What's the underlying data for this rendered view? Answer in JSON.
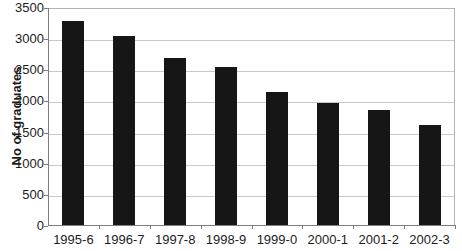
{
  "chart_data": {
    "type": "bar",
    "title": "",
    "xlabel": "",
    "ylabel": "No of graduates",
    "categories": [
      "1995-6",
      "1996-7",
      "1997-8",
      "1998-9",
      "1999-0",
      "2000-1",
      "2001-2",
      "2002-3"
    ],
    "values": [
      3300,
      3050,
      2700,
      2550,
      2150,
      1980,
      1860,
      1630
    ],
    "ylim": [
      0,
      3500
    ],
    "yticks": [
      0,
      500,
      1000,
      1500,
      2000,
      2500,
      3000,
      3500
    ],
    "grid": true,
    "legend_position": "none",
    "colors": {
      "bar": "#161616",
      "gridline": "#c9c9c9",
      "frame": "#b3b3b3",
      "axis": "#7d7d7d",
      "text": "#1c1c1c",
      "background": "#ffffff"
    }
  }
}
